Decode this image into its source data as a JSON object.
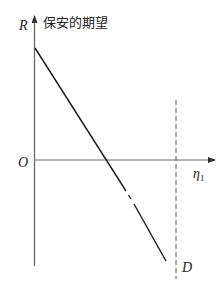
{
  "diagram": {
    "title": "保安的期望",
    "y_axis_label": "R",
    "x_axis_label": "η",
    "x_axis_label_subscript": "1",
    "origin_label": "O",
    "dashed_line_label": "D",
    "colors": {
      "axis": "#6a6a6a",
      "line": "#1a1a1a",
      "dashed": "#555555",
      "text": "#222222"
    }
  }
}
